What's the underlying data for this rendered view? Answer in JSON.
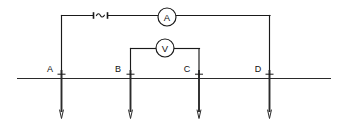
{
  "diagram": {
    "type": "electrical-circuit-schematic",
    "ground": {
      "label": "ground-surface-line",
      "y": 78,
      "x_start": 17,
      "x_end": 331
    },
    "source": {
      "name": "ac-source",
      "symbol": "~",
      "x": 100,
      "y": 15
    },
    "meters": [
      {
        "name": "ammeter",
        "label": "A",
        "cx": 167,
        "cy": 17,
        "r": 9
      },
      {
        "name": "voltmeter",
        "label": "V",
        "cx": 165,
        "cy": 48,
        "r": 9
      }
    ],
    "electrodes": [
      {
        "label": "A",
        "role": "current-electrode",
        "x": 61,
        "label_x": 50,
        "label_y": 72
      },
      {
        "label": "B",
        "role": "potential-electrode",
        "x": 130,
        "label_x": 118,
        "label_y": 72
      },
      {
        "label": "C",
        "role": "potential-electrode",
        "x": 199,
        "label_x": 187,
        "label_y": 72
      },
      {
        "label": "D",
        "role": "current-electrode",
        "x": 270,
        "label_x": 258,
        "label_y": 72
      }
    ],
    "circuits": [
      {
        "name": "current-circuit",
        "description": "Electrode A up, across through AC source and ammeter, down to electrode D",
        "wire_y": 15
      },
      {
        "name": "potential-circuit",
        "description": "Electrode B up, across through voltmeter, down to electrode C",
        "wire_y": 48
      }
    ],
    "colors": {
      "wire": "#1a1a1a",
      "ground": "#2a2a2a",
      "stake": "#2b2b2b",
      "background": "#ffffff"
    }
  }
}
